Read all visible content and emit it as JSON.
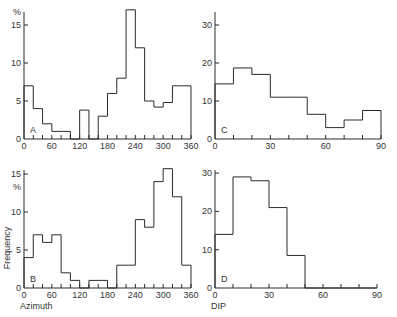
{
  "figure": {
    "background": "#ffffff",
    "line_color": "#2a2a2a"
  },
  "chart_data": [
    {
      "panel": "A",
      "type": "bar",
      "style": "step-histogram",
      "bin_width": 20,
      "x": [
        0,
        20,
        40,
        60,
        80,
        100,
        120,
        140,
        160,
        180,
        200,
        220,
        240,
        260,
        280,
        300,
        320,
        340
      ],
      "values": [
        7,
        4,
        2,
        1,
        1,
        0,
        3.8,
        0,
        3,
        6,
        8,
        17,
        12,
        5,
        4.2,
        4.8,
        7,
        7
      ],
      "xlim": [
        0,
        360
      ],
      "ylim": [
        0,
        17
      ],
      "xticks": [
        "0",
        "60",
        "120",
        "180",
        "240",
        "300",
        "360"
      ],
      "yticks": [
        "0",
        "5",
        "10",
        "15"
      ],
      "yunit": "%",
      "xlabel": "",
      "ylabel": "",
      "grid": false
    },
    {
      "panel": "C",
      "type": "bar",
      "style": "step-histogram",
      "bin_width": 10,
      "x": [
        0,
        10,
        20,
        30,
        40,
        50,
        60,
        70,
        80
      ],
      "values": [
        14.5,
        18.7,
        17,
        11,
        11,
        6.5,
        3,
        5,
        7.5
      ],
      "xlim": [
        0,
        90
      ],
      "ylim": [
        0,
        30
      ],
      "xticks": [
        "0",
        "30",
        "60",
        "90"
      ],
      "yticks": [
        "0",
        "10",
        "20",
        "30"
      ],
      "xlabel": "",
      "ylabel": "",
      "grid": false
    },
    {
      "panel": "B",
      "type": "bar",
      "style": "step-histogram",
      "bin_width": 20,
      "x": [
        0,
        20,
        40,
        60,
        80,
        100,
        120,
        140,
        160,
        180,
        200,
        220,
        240,
        260,
        280,
        300,
        320,
        340
      ],
      "values": [
        4,
        7,
        6,
        7,
        2,
        1,
        0,
        1,
        1,
        0,
        3,
        3,
        9,
        8,
        14,
        15.7,
        12,
        3
      ],
      "xlim": [
        0,
        360
      ],
      "ylim": [
        0,
        16
      ],
      "xticks": [
        "0",
        "60",
        "120",
        "180",
        "240",
        "300",
        "360"
      ],
      "yticks": [
        "0",
        "5",
        "10",
        "15"
      ],
      "yunit": "%",
      "xlabel": "Azimuth",
      "ylabel": "Frequency",
      "grid": false
    },
    {
      "panel": "D",
      "type": "bar",
      "style": "step-histogram",
      "bin_width": 10,
      "x": [
        0,
        10,
        20,
        30,
        40,
        50,
        60,
        70,
        80
      ],
      "values": [
        14,
        29,
        28,
        21,
        8.5,
        0,
        0,
        0,
        0
      ],
      "xlim": [
        0,
        90
      ],
      "ylim": [
        0,
        30
      ],
      "xticks": [
        "0",
        "30",
        "60",
        "90"
      ],
      "yticks": [
        "0",
        "10",
        "20",
        "30"
      ],
      "xlabel": "DIP",
      "ylabel": "",
      "grid": false
    }
  ]
}
